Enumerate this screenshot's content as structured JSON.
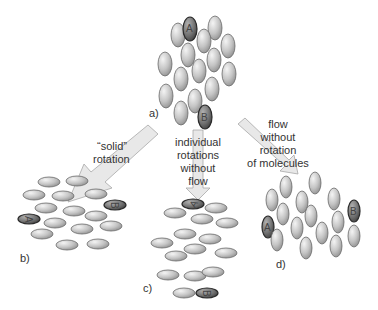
{
  "colors": {
    "molecule_fill": "#c8c8c8",
    "molecule_stroke": "#6a6a6a",
    "marked_fill": "#7a7a7a",
    "marked_stroke": "#2a2a2a",
    "arrow_fill": "#e8e8e8",
    "arrow_stroke": "#aaaaaa",
    "text": "#333333"
  },
  "panels": {
    "a": {
      "label": "a)",
      "marked": [
        "A",
        "B"
      ]
    },
    "b": {
      "label": "b)",
      "marked": [
        "A",
        "B"
      ]
    },
    "c": {
      "label": "c)",
      "marked": [
        "A",
        "B"
      ]
    },
    "d": {
      "label": "d)",
      "marked": [
        "A",
        "B"
      ]
    }
  },
  "arrows": {
    "solid": {
      "lines": [
        "“solid”",
        "rotation"
      ]
    },
    "individual": {
      "lines": [
        "individual",
        "rotations",
        "without",
        "flow"
      ]
    },
    "flow": {
      "lines": [
        "flow",
        "without",
        "rotation",
        "of molecules"
      ]
    }
  },
  "molecule_labels": {
    "A": "A",
    "B": "B"
  }
}
